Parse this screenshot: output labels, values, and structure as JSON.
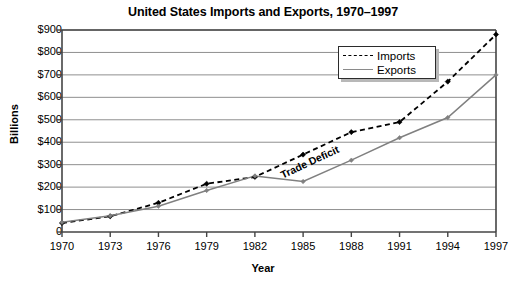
{
  "chart_data": {
    "type": "line",
    "title": "United States Imports and Exports, 1970–1997",
    "xlabel": "Year",
    "ylabel": "Billions",
    "x": [
      1970,
      1973,
      1976,
      1979,
      1982,
      1985,
      1988,
      1991,
      1994,
      1997
    ],
    "xtick_labels": [
      "1970",
      "1973",
      "1976",
      "1979",
      "1982",
      "1985",
      "1988",
      "1991",
      "1994",
      "1997"
    ],
    "ytick_labels": [
      "$900",
      "$800",
      "$700",
      "$600",
      "$500",
      "$400",
      "$300",
      "$200",
      "$100",
      "0"
    ],
    "ytick_values": [
      900,
      800,
      700,
      600,
      500,
      400,
      300,
      200,
      100,
      0
    ],
    "ylim": [
      0,
      900
    ],
    "xlim": [
      1970,
      1997
    ],
    "grid": true,
    "legend_position": "top-right",
    "series": [
      {
        "name": "Imports",
        "style": "dashed",
        "color": "#000000",
        "marker": "diamond",
        "values": [
          40,
          70,
          130,
          215,
          245,
          345,
          445,
          490,
          670,
          880
        ]
      },
      {
        "name": "Exports",
        "style": "solid",
        "color": "#808080",
        "marker": "diamond",
        "values": [
          43,
          72,
          115,
          185,
          250,
          225,
          320,
          420,
          510,
          700
        ]
      }
    ],
    "annotations": [
      {
        "text": "Trade Deficit",
        "x": 1985.4,
        "y": 300,
        "rotation": -25
      }
    ]
  },
  "legend": {
    "items": [
      {
        "label": "Imports",
        "style": "dashed"
      },
      {
        "label": "Exports",
        "style": "solid"
      }
    ]
  }
}
